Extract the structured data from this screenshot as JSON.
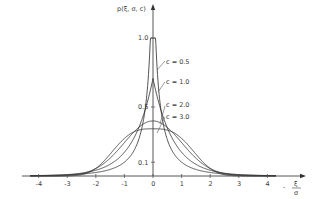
{
  "chart_data": {
    "type": "line",
    "title": "",
    "xlabel": "ξ/σ",
    "ylabel": "p(ξ, σ, c)",
    "xlim": [
      -4.3,
      5.3
    ],
    "ylim": [
      0,
      1.2
    ],
    "x_ticks": [
      -4,
      -3,
      -2,
      -1,
      0,
      1,
      2,
      3,
      4
    ],
    "x_tick_labels": [
      "-4",
      "-3",
      "-2",
      "-1",
      "0",
      "1",
      "2",
      "3",
      "4"
    ],
    "y_ticks": [
      0.1,
      0.5,
      1.0
    ],
    "y_tick_labels": [
      "0.1",
      "0.5",
      "1.0"
    ],
    "grid": false,
    "legend_position": "inline labels with leader lines, right of peak",
    "series": [
      {
        "name": "c = 0.5",
        "c": 0.5,
        "peak": 1.0,
        "x": [
          -4,
          -3,
          -2,
          -1,
          -0.5,
          -0.2,
          0,
          0.2,
          0.5,
          1,
          2,
          3,
          4
        ],
        "values": [
          0.006,
          0.011,
          0.02,
          0.045,
          0.08,
          0.16,
          1.0,
          0.16,
          0.08,
          0.045,
          0.02,
          0.011,
          0.006
        ]
      },
      {
        "name": "c = 1.0",
        "c": 1.0,
        "peak": 0.707,
        "x": [
          -4,
          -3,
          -2,
          -1,
          -0.5,
          0,
          0.5,
          1,
          2,
          3,
          4
        ],
        "values": [
          0.002,
          0.01,
          0.042,
          0.172,
          0.35,
          0.707,
          0.35,
          0.172,
          0.042,
          0.01,
          0.002
        ]
      },
      {
        "name": "c = 2.0",
        "c": 2.0,
        "peak": 0.399,
        "x": [
          -4,
          -3,
          -2,
          -1,
          -0.5,
          0,
          0.5,
          1,
          2,
          3,
          4
        ],
        "values": [
          0.0001,
          0.004,
          0.054,
          0.242,
          0.352,
          0.399,
          0.352,
          0.242,
          0.054,
          0.004,
          0.0001
        ]
      },
      {
        "name": "c = 3.0",
        "c": 3.0,
        "peak": 0.35,
        "x": [
          -4,
          -3,
          -2,
          -1,
          -0.5,
          0,
          0.5,
          1,
          2,
          3,
          4
        ],
        "values": [
          0.0,
          0.0,
          0.03,
          0.26,
          0.33,
          0.35,
          0.33,
          0.26,
          0.03,
          0.0,
          0.0
        ]
      }
    ],
    "annotations": [
      "c = 0.5",
      "c = 1.0",
      "c = 2.0",
      "c = 3.0"
    ]
  },
  "labels": {
    "ylabel": "p(ξ, σ, c)",
    "xlabel_num": "ξ",
    "xlabel_den": "σ",
    "x_dash": "-",
    "series_labels": [
      "c = 0.5",
      "c = 1.0",
      "c = 2.0",
      "c = 3.0"
    ]
  }
}
